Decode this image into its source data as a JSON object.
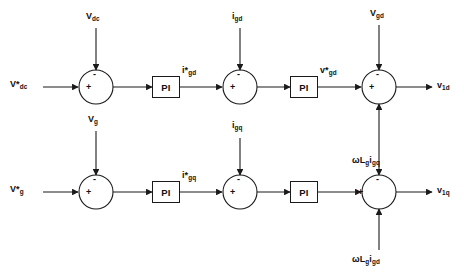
{
  "diagram": {
    "stroke_color": "#1a1a1a",
    "background_color": "#ffffff"
  },
  "blocks": {
    "pi_label": "PI",
    "pi_outer_d": "PI",
    "pi_inner_d": "PI",
    "pi_outer_q": "PI",
    "pi_inner_q": "PI"
  },
  "signs": {
    "plus": "+",
    "minus": "-"
  },
  "top_loop": {
    "reference_input": {
      "base": "V",
      "star": "*",
      "sub": "dc",
      "text": "V*dc"
    },
    "feedback_1": {
      "base": "V",
      "sub": "dc",
      "text": "Vdc"
    },
    "mid_signal": {
      "base": "i",
      "star": "*",
      "sub": "gd",
      "text": "i*gd"
    },
    "feedback_2": {
      "base": "i",
      "sub": "gd",
      "text": "igd"
    },
    "post_pi_signal": {
      "base": "v",
      "star": "*",
      "sub": "gd",
      "text": "v*gd"
    },
    "feedforward_top": {
      "base": "V",
      "sub": "gd",
      "text": "Vgd"
    },
    "coupling_term": {
      "text": "ωL",
      "sub1": "g",
      "mid": "i",
      "sub2": "gq",
      "full": "ωLgigq"
    },
    "output": {
      "base": "v",
      "sub": "1d",
      "text": "v1d"
    }
  },
  "bottom_loop": {
    "reference_input": {
      "base": "V",
      "star": "*",
      "sub": "g",
      "text": "V*g"
    },
    "feedback_1": {
      "base": "V",
      "sub": "g",
      "text": "Vg"
    },
    "mid_signal": {
      "base": "i",
      "star": "*",
      "sub": "gq",
      "text": "i*gq"
    },
    "feedback_2": {
      "base": "i",
      "sub": "gq",
      "text": "igq"
    },
    "coupling_term": {
      "text": "ωL",
      "sub1": "g",
      "mid": "i",
      "sub2": "gd",
      "full": "ωLgigd"
    },
    "output": {
      "base": "v",
      "sub": "1q",
      "text": "v1q"
    }
  }
}
